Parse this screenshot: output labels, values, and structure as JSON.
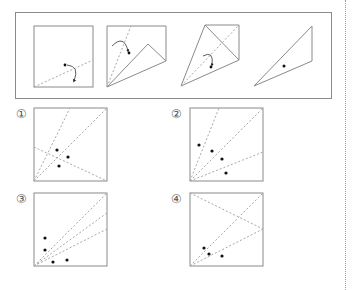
{
  "problem": {
    "steps": [
      {
        "id": "step-1",
        "description": "square with dotted diagonal line and fold arrow, hole punched"
      },
      {
        "id": "step-2",
        "description": "square with lower-right corner folded up"
      },
      {
        "id": "step-3",
        "description": "kite shape after second fold with fold arrow"
      },
      {
        "id": "step-4",
        "description": "final folded triangle with punched hole"
      }
    ]
  },
  "options": [
    {
      "label": "①",
      "number": 1
    },
    {
      "label": "②",
      "number": 2
    },
    {
      "label": "③",
      "number": 3
    },
    {
      "label": "④",
      "number": 4
    }
  ],
  "colors": {
    "line": "#8a8a8a",
    "dotted": "#a8a8a8",
    "dot": "#111111"
  }
}
